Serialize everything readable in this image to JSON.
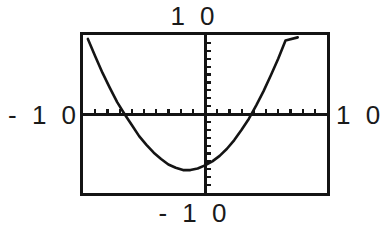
{
  "screen": {
    "title": "graphing-calculator-viewing-window",
    "background_color": "#ffffff",
    "ink_color": "#141414"
  },
  "labels": {
    "top": "1 0",
    "bottom": "- 1 0",
    "left": "- 1 0",
    "right": "1 0"
  },
  "window": {
    "xmin": -10,
    "xmax": 10,
    "ymin": -10,
    "ymax": 10,
    "xscl": 1,
    "yscl": 1
  },
  "chart_data": {
    "type": "line",
    "title": "",
    "xlabel": "",
    "ylabel": "",
    "xlim": [
      -10,
      10
    ],
    "ylim": [
      -10,
      10
    ],
    "grid": false,
    "legend": "none",
    "axes": {
      "x_axis_at_y": 0,
      "y_axis_at_x": 0,
      "x_tick_interval": 1,
      "y_tick_interval": 1,
      "x_ticks": [
        -9,
        -8,
        -7,
        -6,
        -5,
        -4,
        -3,
        -2,
        -1,
        1,
        2,
        3,
        4,
        5,
        6,
        7,
        8,
        9
      ],
      "y_ticks": [
        -9,
        -8,
        -7,
        -6,
        -5,
        -4,
        -3,
        -2,
        -1,
        1,
        2,
        3,
        4,
        5,
        6,
        7,
        8,
        9
      ]
    },
    "annotations": {
      "axis_range_labels": [
        "10",
        "-10",
        "-10",
        "10"
      ],
      "vertex": [
        -1.6,
        -7.1
      ],
      "x_intercepts": [
        -6.6,
        2.8
      ],
      "y_intercept": -6.5
    },
    "series": [
      {
        "name": "parabola",
        "kind": "quadratic",
        "color": "#141414",
        "x": [
          -9.6,
          -9.0,
          -8.4,
          -7.8,
          -7.2,
          -6.6,
          -6.0,
          -5.4,
          -4.8,
          -4.2,
          -3.6,
          -3.0,
          -2.4,
          -1.8,
          -1.2,
          -0.6,
          0.0,
          0.6,
          1.2,
          1.8,
          2.4,
          3.0,
          3.6,
          4.2,
          4.8,
          5.4,
          6.0,
          6.6,
          7.2,
          7.6
        ],
        "y": [
          9.5,
          7.3,
          5.2,
          3.3,
          1.5,
          0.0,
          -1.4,
          -2.8,
          -3.9,
          -4.9,
          -5.7,
          -6.4,
          -6.8,
          -7.1,
          -7.1,
          -6.9,
          -6.5,
          -6.0,
          -5.3,
          -4.4,
          -3.3,
          -2.0,
          -0.6,
          1.1,
          2.9,
          4.9,
          7.0,
          9.3,
          11.8,
          9.7
        ]
      }
    ]
  }
}
